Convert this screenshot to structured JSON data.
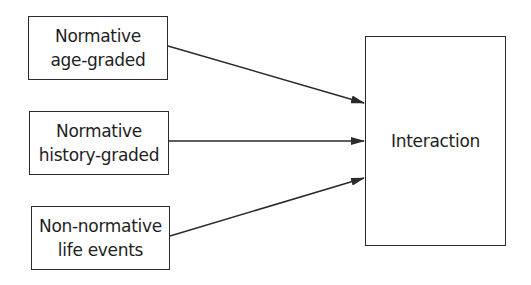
{
  "diagram": {
    "inputs": [
      {
        "id": "age-graded",
        "lines": [
          "Normative",
          "age-graded"
        ]
      },
      {
        "id": "history-graded",
        "lines": [
          "Normative",
          "history-graded"
        ]
      },
      {
        "id": "life-events",
        "lines": [
          "Non-normative",
          "life events"
        ]
      }
    ],
    "output": {
      "id": "interaction",
      "label": "Interaction"
    },
    "edges": [
      {
        "from": "age-graded",
        "to": "interaction"
      },
      {
        "from": "history-graded",
        "to": "interaction"
      },
      {
        "from": "life-events",
        "to": "interaction"
      }
    ],
    "colors": {
      "stroke": "#2a2a2a",
      "text": "#1e1e1e",
      "background": "#ffffff"
    }
  }
}
